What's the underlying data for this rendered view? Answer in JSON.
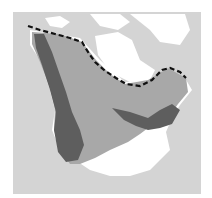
{
  "map": {
    "region": "North America",
    "type": "species range map",
    "colors": {
      "ocean": "#d4d4d4",
      "land_outside_range": "#ffffff",
      "range": "#a8a8a8",
      "core_range": "#5e5e5e",
      "boundary_line": "#111111"
    },
    "layers": [
      {
        "name": "range",
        "color": "#a8a8a8"
      },
      {
        "name": "core-range",
        "color": "#5e5e5e"
      },
      {
        "name": "northern-limit",
        "style": "dashed"
      }
    ]
  }
}
